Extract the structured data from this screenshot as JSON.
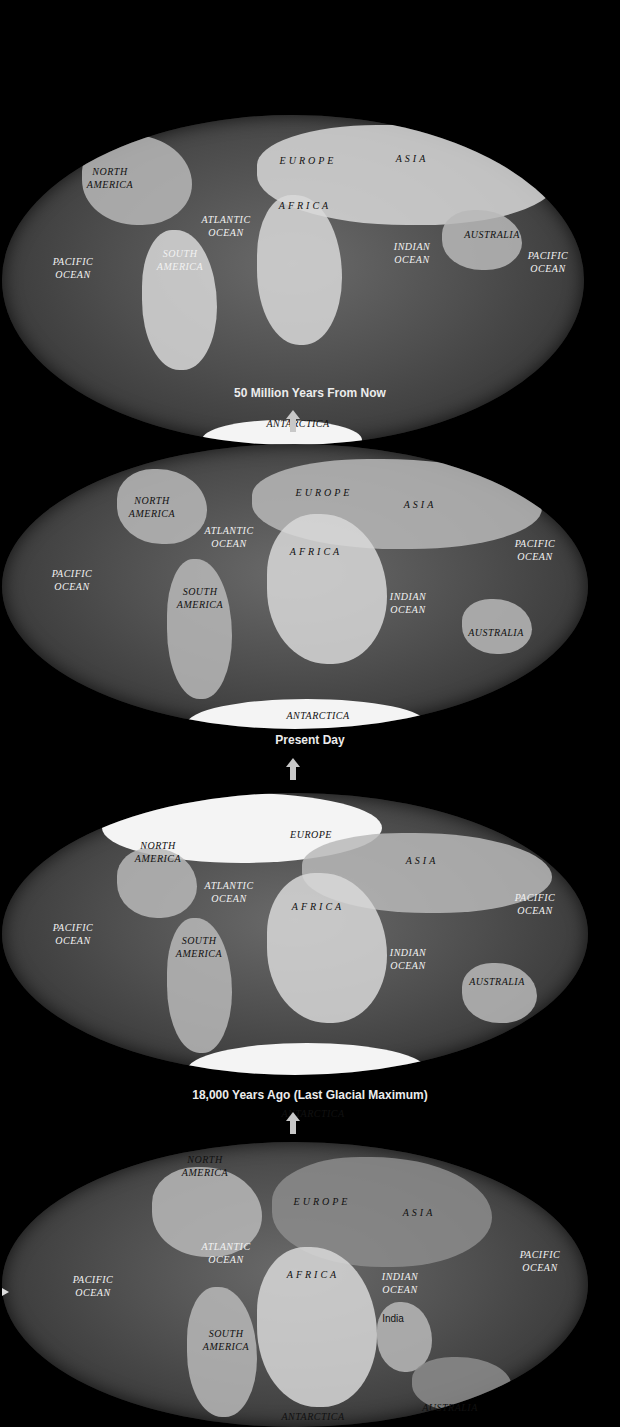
{
  "panels": [
    {
      "caption": "50 Million Years From Now",
      "labels": {
        "north_america": "NORTH\nAMERICA",
        "europe": "EUROPE",
        "asia": "ASIA",
        "africa": "AFRICA",
        "atlantic_ocean": "ATLANTIC\nOCEAN",
        "south_america": "SOUTH\nAMERICA",
        "pacific_ocean_west": "PACIFIC\nOCEAN",
        "indian_ocean": "INDIAN\nOCEAN",
        "australia": "AUSTRALIA",
        "pacific_ocean_east": "PACIFIC\nOCEAN",
        "antarctica": "ANTARCTICA"
      }
    },
    {
      "caption": "Present Day",
      "labels": {
        "north_america": "NORTH\nAMERICA",
        "europe": "EUROPE",
        "asia": "ASIA",
        "africa": "AFRICA",
        "atlantic_ocean": "ATLANTIC\nOCEAN",
        "south_america": "SOUTH\nAMERICA",
        "pacific_ocean_west": "PACIFIC\nOCEAN",
        "indian_ocean": "INDIAN\nOCEAN",
        "australia": "AUSTRALIA",
        "pacific_ocean_east": "PACIFIC\nOCEAN",
        "antarctica": "ANTARCTICA"
      }
    },
    {
      "caption": "18,000 Years Ago (Last Glacial Maximum)",
      "labels": {
        "north_america": "NORTH\nAMERICA",
        "europe": "EUROPE",
        "asia": "ASIA",
        "africa": "AFRICA",
        "atlantic_ocean": "ATLANTIC\nOCEAN",
        "south_america": "SOUTH\nAMERICA",
        "pacific_ocean_west": "PACIFIC\nOCEAN",
        "indian_ocean": "INDIAN\nOCEAN",
        "australia": "AUSTRALIA",
        "pacific_ocean_east": "PACIFIC\nOCEAN",
        "antarctica": "ANTARCTICA"
      }
    },
    {
      "caption": "",
      "labels": {
        "north_america": "NORTH\nAMERICA",
        "europe": "EUROPE",
        "asia": "ASIA",
        "africa": "AFRICA",
        "atlantic_ocean": "ATLANTIC\nOCEAN",
        "south_america": "SOUTH\nAMERICA",
        "pacific_ocean_west": "PACIFIC\nOCEAN",
        "indian_ocean": "INDIAN\nOCEAN",
        "india": "India",
        "australia": "AUSTRALIA",
        "pacific_ocean_east": "PACIFIC\nOCEAN",
        "antarctica": "ANTARCTICA"
      }
    }
  ]
}
